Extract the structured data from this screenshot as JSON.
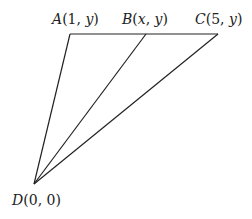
{
  "diagram": {
    "points": [
      {
        "id": "A",
        "name": "A",
        "coords": "(1, y)",
        "x_label": "1",
        "y_label": "y",
        "px": 70,
        "py": 34
      },
      {
        "id": "B",
        "name": "B",
        "coords": "(x, y)",
        "x_label": "x",
        "y_label": "y",
        "px": 146,
        "py": 34
      },
      {
        "id": "C",
        "name": "C",
        "coords": "(5, y)",
        "x_label": "5",
        "y_label": "y",
        "px": 218,
        "py": 34
      },
      {
        "id": "D",
        "name": "D",
        "coords": "(0, 0)",
        "x_label": "0",
        "y_label": "0",
        "px": 34,
        "py": 184
      }
    ],
    "segments": [
      {
        "from": "A",
        "to": "C"
      },
      {
        "from": "D",
        "to": "A"
      },
      {
        "from": "D",
        "to": "B"
      },
      {
        "from": "D",
        "to": "C"
      }
    ],
    "stroke_color": "#222222"
  }
}
